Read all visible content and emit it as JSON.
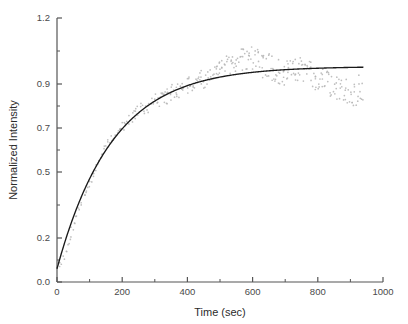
{
  "chart_data": {
    "type": "scatter",
    "title": "",
    "subtitle": "",
    "xlabel": "Time (sec)",
    "ylabel": "Normalized Intensity",
    "xlim": [
      0,
      1000
    ],
    "ylim": [
      0.0,
      1.2
    ],
    "xticks": [
      0,
      200,
      400,
      600,
      800,
      1000
    ],
    "xtick_labels": [
      "0",
      "200",
      "400",
      "600",
      "800",
      "1000"
    ],
    "yticks": [
      0.0,
      0.2,
      0.5,
      0.7,
      0.9,
      1.2
    ],
    "ytick_labels": [
      "0.0",
      "0.2",
      "0.5",
      "0.7",
      "0.9",
      "1.2"
    ],
    "minor_ticks": true,
    "grid": false,
    "legend": null,
    "legend_position": "none",
    "annotations": [],
    "colors": {
      "data_points": "#b4b4b4",
      "fit_curve": "#1a1a1a",
      "axis": "#555555",
      "text": "#3a3a3a",
      "background": "#ffffff"
    },
    "series": [
      {
        "name": "data",
        "style": "scatter",
        "marker": "dot",
        "color": "#b4b4b4",
        "x": [
          5,
          12,
          19,
          26,
          33,
          40,
          47,
          54,
          61,
          68,
          75,
          82,
          89,
          96,
          103,
          110,
          117,
          124,
          131,
          138,
          145,
          152,
          159,
          166,
          173,
          180,
          187,
          194,
          201,
          208,
          215,
          222,
          229,
          236,
          243,
          250,
          257,
          264,
          271,
          278,
          285,
          292,
          299,
          306,
          313,
          320,
          327,
          334,
          341,
          348,
          355,
          362,
          369,
          376,
          383,
          390,
          397,
          404,
          411,
          418,
          425,
          432,
          439,
          446,
          453,
          460,
          467,
          474,
          481,
          488,
          495,
          502,
          509,
          516,
          523,
          530,
          537,
          544,
          551,
          558,
          565,
          572,
          579,
          586,
          593,
          600,
          607,
          614,
          621,
          628,
          635,
          642,
          649,
          656,
          663,
          670,
          677,
          684,
          691,
          698,
          705,
          712,
          719,
          726,
          733,
          740,
          747,
          754,
          761,
          768,
          775,
          782,
          789,
          796,
          803,
          810,
          817,
          824,
          831,
          838,
          845,
          852,
          859,
          866,
          873,
          880,
          887,
          894,
          901,
          908,
          915,
          922,
          929,
          936
        ],
        "y": [
          0.075,
          0.085,
          0.11,
          0.14,
          0.17,
          0.2,
          0.24,
          0.27,
          0.3,
          0.33,
          0.36,
          0.39,
          0.42,
          0.44,
          0.47,
          0.49,
          0.52,
          0.54,
          0.56,
          0.58,
          0.6,
          0.62,
          0.635,
          0.65,
          0.665,
          0.675,
          0.685,
          0.695,
          0.705,
          0.715,
          0.725,
          0.735,
          0.745,
          0.755,
          0.765,
          0.775,
          0.785,
          0.79,
          0.795,
          0.8,
          0.81,
          0.815,
          0.82,
          0.825,
          0.83,
          0.835,
          0.84,
          0.845,
          0.85,
          0.855,
          0.86,
          0.865,
          0.87,
          0.875,
          0.88,
          0.885,
          0.89,
          0.895,
          0.9,
          0.905,
          0.91,
          0.915,
          0.92,
          0.925,
          0.93,
          0.935,
          0.94,
          0.945,
          0.95,
          0.955,
          0.96,
          0.965,
          0.97,
          0.975,
          0.98,
          0.985,
          0.99,
          0.995,
          1.0,
          1.005,
          1.01,
          1.015,
          1.02,
          1.02,
          1.02,
          1.015,
          1.01,
          1.005,
          1.0,
          0.995,
          0.99,
          0.985,
          0.98,
          0.975,
          0.97,
          0.965,
          0.96,
          0.955,
          0.95,
          0.95,
          0.95,
          0.955,
          0.96,
          0.965,
          0.97,
          0.97,
          0.965,
          0.96,
          0.955,
          0.95,
          0.945,
          0.94,
          0.935,
          0.93,
          0.925,
          0.92,
          0.915,
          0.91,
          0.905,
          0.9,
          0.895,
          0.89,
          0.885,
          0.88,
          0.875,
          0.87,
          0.865,
          0.86,
          0.855,
          0.85,
          0.86,
          0.87,
          0.88,
          0.885
        ]
      },
      {
        "name": "exponential fit",
        "style": "line",
        "color": "#1a1a1a",
        "model": "y = 0.98 * (1 - exp(-t/170)) + 0.06 * exp(-t/170)",
        "plateau": 0.98,
        "y0": 0.06,
        "tau": 170,
        "x_range": [
          0,
          940
        ]
      }
    ]
  }
}
